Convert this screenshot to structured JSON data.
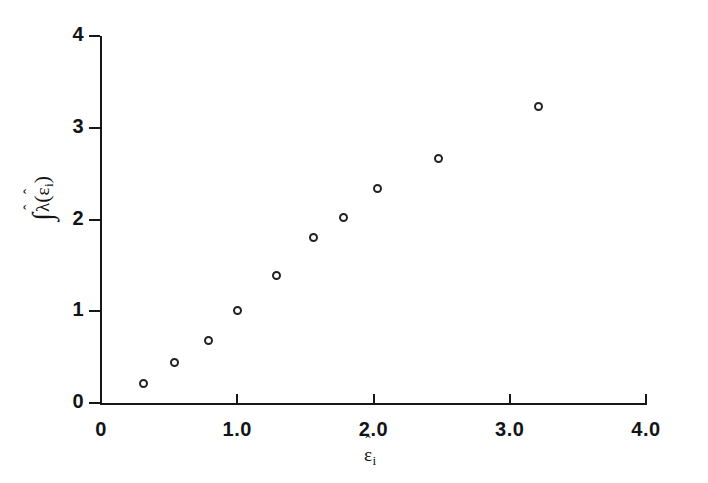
{
  "chart_data": {
    "type": "scatter",
    "title": "",
    "subtitle": "",
    "xlabel": "ε̂ᵢ",
    "ylabel": "∫λ̂(ε̂ᵢ)",
    "xlabel_parts": {
      "base": "ε",
      "hat": "ˆ",
      "sub": "i"
    },
    "ylabel_parts": {
      "integral": "∫",
      "lambda": "λ",
      "hat": "ˆ",
      "base": "ε",
      "sub": "i"
    },
    "xlim": [
      0,
      4.0
    ],
    "ylim": [
      0,
      4
    ],
    "xticks": [
      "0",
      "1.0",
      "2.0",
      "3.0",
      "4.0"
    ],
    "xtick_values": [
      0,
      1.0,
      2.0,
      3.0,
      4.0
    ],
    "yticks": [
      "0",
      "1",
      "2",
      "3",
      "4"
    ],
    "ytick_values": [
      0,
      1,
      2,
      3,
      4
    ],
    "grid": false,
    "legend": null,
    "marker": "open-circle",
    "x": [
      0.31,
      0.54,
      0.79,
      1.0,
      1.29,
      1.56,
      1.78,
      2.03,
      2.48,
      3.21
    ],
    "y": [
      0.21,
      0.44,
      0.68,
      1.01,
      1.39,
      1.8,
      2.02,
      2.34,
      2.66,
      3.23
    ],
    "points": [
      {
        "x": 0.31,
        "y": 0.21
      },
      {
        "x": 0.54,
        "y": 0.44
      },
      {
        "x": 0.79,
        "y": 0.68
      },
      {
        "x": 1.0,
        "y": 1.01
      },
      {
        "x": 1.29,
        "y": 1.39
      },
      {
        "x": 1.56,
        "y": 1.8
      },
      {
        "x": 1.78,
        "y": 2.02
      },
      {
        "x": 2.03,
        "y": 2.34
      },
      {
        "x": 2.48,
        "y": 2.66
      },
      {
        "x": 3.21,
        "y": 3.23
      }
    ],
    "colors": {
      "axis": "#15171a",
      "marker_edge": "#202226",
      "marker_fill": "#ffffff",
      "background": "#ffffff",
      "text": "#121417"
    }
  }
}
